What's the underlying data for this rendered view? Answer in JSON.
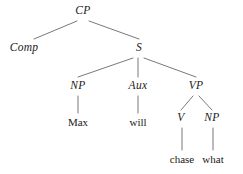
{
  "figure": {
    "kind": "syntax-tree",
    "sentence_terminals": [
      "Max",
      "will",
      "chase",
      "what"
    ],
    "ink_color": "#1a1a1a",
    "line_color": "#555555",
    "background_color": "#ffffff"
  },
  "nodes": {
    "cp": {
      "label": "CP",
      "x": 83,
      "y": 11,
      "type": "nonterminal"
    },
    "comp": {
      "label": "Comp",
      "x": 24,
      "y": 48,
      "type": "nonterminal"
    },
    "s": {
      "label": "S",
      "x": 139,
      "y": 48,
      "type": "nonterminal"
    },
    "np_subject": {
      "label": "NP",
      "x": 78,
      "y": 86,
      "type": "nonterminal"
    },
    "aux": {
      "label": "Aux",
      "x": 138,
      "y": 86,
      "type": "nonterminal"
    },
    "vp": {
      "label": "VP",
      "x": 196,
      "y": 86,
      "type": "nonterminal"
    },
    "v": {
      "label": "V",
      "x": 181,
      "y": 118,
      "type": "nonterminal"
    },
    "np_object": {
      "label": "NP",
      "x": 212,
      "y": 118,
      "type": "nonterminal"
    },
    "max": {
      "label": "Max",
      "x": 78,
      "y": 122,
      "type": "terminal"
    },
    "will": {
      "label": "will",
      "x": 138,
      "y": 122,
      "type": "terminal"
    },
    "chase": {
      "label": "chase",
      "x": 182,
      "y": 159,
      "type": "terminal"
    },
    "what": {
      "label": "what",
      "x": 213,
      "y": 159,
      "type": "terminal"
    }
  },
  "edges": [
    {
      "name": "cp-to-comp",
      "x1": 77,
      "y1": 21,
      "x2": 34,
      "y2": 39
    },
    {
      "name": "cp-to-s",
      "x1": 89,
      "y1": 21,
      "x2": 139,
      "y2": 39
    },
    {
      "name": "s-to-np",
      "x1": 133,
      "y1": 58,
      "x2": 78,
      "y2": 77
    },
    {
      "name": "s-to-aux",
      "x1": 138,
      "y1": 58,
      "x2": 138,
      "y2": 77
    },
    {
      "name": "s-to-vp",
      "x1": 144,
      "y1": 58,
      "x2": 196,
      "y2": 77
    },
    {
      "name": "np-to-max",
      "x1": 78,
      "y1": 96,
      "x2": 78,
      "y2": 113
    },
    {
      "name": "aux-to-will",
      "x1": 138,
      "y1": 96,
      "x2": 138,
      "y2": 113
    },
    {
      "name": "vp-to-v",
      "x1": 193,
      "y1": 96,
      "x2": 181,
      "y2": 110
    },
    {
      "name": "vp-to-np",
      "x1": 199,
      "y1": 96,
      "x2": 212,
      "y2": 110
    },
    {
      "name": "v-to-chase",
      "x1": 182,
      "y1": 128,
      "x2": 182,
      "y2": 150
    },
    {
      "name": "np-to-what",
      "x1": 213,
      "y1": 128,
      "x2": 213,
      "y2": 150
    }
  ]
}
